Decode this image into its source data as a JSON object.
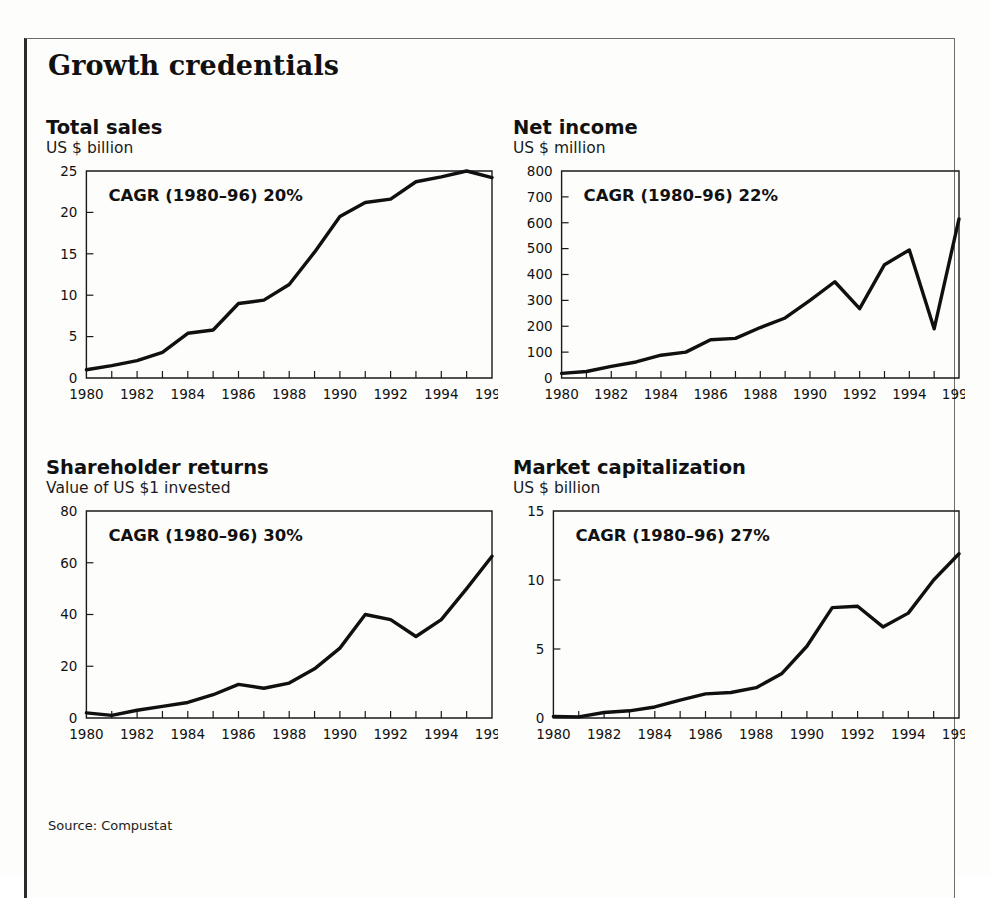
{
  "exhibit": {
    "title": "Growth credentials",
    "source": "Source: Compustat"
  },
  "axis": {
    "x_tick_labels": [
      "1980",
      "1982",
      "1984",
      "1986",
      "1988",
      "1990",
      "1992",
      "1994",
      "1996"
    ],
    "x_all_years": [
      1980,
      1981,
      1982,
      1983,
      1984,
      1985,
      1986,
      1987,
      1988,
      1989,
      1990,
      1991,
      1992,
      1993,
      1994,
      1995,
      1996
    ]
  },
  "chart_data": [
    {
      "type": "line",
      "title": "Total sales",
      "subtitle": "US $ billion",
      "annotation": "CAGR (1980–96) 20%",
      "xlabel": "",
      "ylabel": "US $ billion",
      "x": [
        1980,
        1981,
        1982,
        1983,
        1984,
        1985,
        1986,
        1987,
        1988,
        1989,
        1990,
        1991,
        1992,
        1993,
        1994,
        1995,
        1996
      ],
      "values": [
        1.0,
        1.5,
        2.1,
        3.1,
        5.4,
        5.8,
        9.0,
        9.4,
        11.3,
        15.2,
        19.5,
        21.2,
        21.6,
        23.7,
        24.3,
        25.0,
        24.2
      ],
      "ylim": [
        0,
        25
      ],
      "yticks": [
        0,
        5,
        10,
        15,
        20,
        25
      ],
      "ytick_labels": [
        "0",
        "5",
        "10",
        "15",
        "20",
        "25"
      ],
      "xlim": [
        1980,
        1996
      ],
      "grid": false,
      "legend": "none"
    },
    {
      "type": "line",
      "title": "Net income",
      "subtitle": "US $ million",
      "annotation": "CAGR (1980–96) 22%",
      "xlabel": "",
      "ylabel": "US $ million",
      "x": [
        1980,
        1981,
        1982,
        1983,
        1984,
        1985,
        1986,
        1987,
        1988,
        1989,
        1990,
        1991,
        1992,
        1993,
        1994,
        1995,
        1996
      ],
      "values": [
        18,
        25,
        45,
        62,
        88,
        100,
        148,
        153,
        195,
        232,
        300,
        372,
        268,
        438,
        495,
        190,
        615
      ],
      "ylim": [
        0,
        800
      ],
      "yticks": [
        0,
        100,
        200,
        300,
        400,
        500,
        600,
        700,
        800
      ],
      "ytick_labels": [
        "0",
        "100",
        "200",
        "300",
        "400",
        "500",
        "600",
        "700",
        "800"
      ],
      "xlim": [
        1980,
        1996
      ],
      "grid": false,
      "legend": "none"
    },
    {
      "type": "line",
      "title": "Shareholder returns",
      "subtitle": "Value of US $1 invested",
      "annotation": "CAGR (1980–96) 30%",
      "xlabel": "",
      "ylabel": "Value of US $1 invested",
      "x": [
        1980,
        1981,
        1982,
        1983,
        1984,
        1985,
        1986,
        1987,
        1988,
        1989,
        1990,
        1991,
        1992,
        1993,
        1994,
        1995,
        1996
      ],
      "values": [
        2.0,
        1.0,
        3.0,
        4.5,
        6.0,
        9.0,
        13.0,
        11.5,
        13.5,
        19.0,
        27.0,
        40.0,
        38.0,
        31.5,
        38.0,
        50.0,
        62.5
      ],
      "ylim": [
        0,
        80
      ],
      "yticks": [
        0,
        20,
        40,
        60,
        80
      ],
      "ytick_labels": [
        "0",
        "20",
        "40",
        "60",
        "80"
      ],
      "xlim": [
        1980,
        1996
      ],
      "grid": false,
      "legend": "none"
    },
    {
      "type": "line",
      "title": "Market capitalization",
      "subtitle": "US $ billion",
      "annotation": "CAGR (1980–96) 27%",
      "xlabel": "",
      "ylabel": "US $ billion",
      "x": [
        1980,
        1981,
        1982,
        1983,
        1984,
        1985,
        1986,
        1987,
        1988,
        1989,
        1990,
        1991,
        1992,
        1993,
        1994,
        1995,
        1996
      ],
      "values": [
        0.12,
        0.08,
        0.4,
        0.52,
        0.8,
        1.3,
        1.75,
        1.85,
        2.2,
        3.2,
        5.2,
        8.0,
        8.1,
        6.6,
        7.6,
        10.0,
        11.9
      ],
      "ylim": [
        0,
        15
      ],
      "yticks": [
        0,
        5,
        10,
        15
      ],
      "ytick_labels": [
        "0",
        "5",
        "10",
        "15"
      ],
      "xlim": [
        1980,
        1996
      ],
      "grid": false,
      "legend": "none"
    }
  ]
}
